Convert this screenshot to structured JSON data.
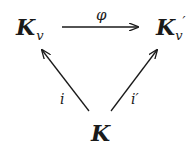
{
  "diagram": {
    "type": "commutative-triangle",
    "nodes": {
      "top_left": {
        "base": "K",
        "sub": "v"
      },
      "top_right": {
        "base": "K",
        "sub": "v",
        "prime": "′"
      },
      "bottom": {
        "base": "K"
      }
    },
    "arrows": [
      {
        "from": "top_left",
        "to": "top_right",
        "label": "φ"
      },
      {
        "from": "bottom",
        "to": "top_left",
        "label": "i"
      },
      {
        "from": "bottom",
        "to": "top_right",
        "label": "i′"
      }
    ],
    "color": "#1a1a1a"
  }
}
